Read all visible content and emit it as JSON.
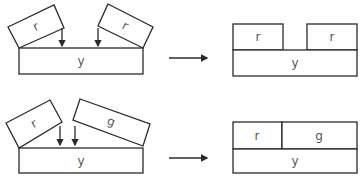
{
  "diagram": {
    "rows": [
      {
        "before": {
          "base": {
            "label": "y"
          },
          "blocks": [
            {
              "label": "r"
            },
            {
              "label": "r"
            }
          ]
        },
        "after": {
          "base": {
            "label": "y"
          },
          "blocks": [
            {
              "label": "r"
            },
            {
              "label": "r"
            }
          ]
        }
      },
      {
        "before": {
          "base": {
            "label": "y"
          },
          "blocks": [
            {
              "label": "r"
            },
            {
              "label": "g"
            }
          ]
        },
        "after": {
          "base": {
            "label": "y"
          },
          "blocks": [
            {
              "label": "r"
            },
            {
              "label": "g"
            }
          ]
        }
      }
    ],
    "colors": {
      "stroke": "#2a2a2a",
      "text": "#555555",
      "background": "#ffffff"
    }
  }
}
